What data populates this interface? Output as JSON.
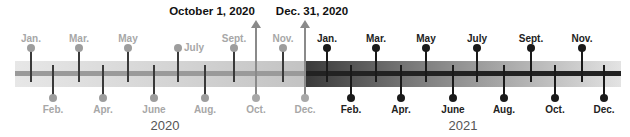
{
  "events": [
    {
      "label": "October 1, 2020",
      "x": 256
    },
    {
      "label": "Dec. 31, 2020",
      "x": 305
    }
  ],
  "years": [
    {
      "label": "2020",
      "x": 165
    },
    {
      "label": "2021",
      "x": 463
    }
  ],
  "months_2020": {
    "top": [
      {
        "label": "Jan.",
        "x": 31
      },
      {
        "label": "Mar.",
        "x": 79
      },
      {
        "label": "May",
        "x": 128
      },
      {
        "label": "July",
        "x": 178
      },
      {
        "label": "Sept.",
        "x": 234
      },
      {
        "label": "Nov.",
        "x": 283
      }
    ],
    "bottom": [
      {
        "label": "Feb.",
        "x": 53
      },
      {
        "label": "Apr.",
        "x": 103
      },
      {
        "label": "June",
        "x": 154
      },
      {
        "label": "Aug.",
        "x": 205
      },
      {
        "label": "Oct.",
        "x": 256
      },
      {
        "label": "Dec.",
        "x": 305
      }
    ]
  },
  "months_2021": {
    "top": [
      {
        "label": "Jan.",
        "x": 327
      },
      {
        "label": "Mar.",
        "x": 376
      },
      {
        "label": "May",
        "x": 426
      },
      {
        "label": "July",
        "x": 477
      },
      {
        "label": "Sept.",
        "x": 531
      },
      {
        "label": "Nov.",
        "x": 582
      }
    ],
    "bottom": [
      {
        "label": "Feb.",
        "x": 351
      },
      {
        "label": "Apr.",
        "x": 401
      },
      {
        "label": "June",
        "x": 453
      },
      {
        "label": "Aug.",
        "x": 504
      },
      {
        "label": "Oct.",
        "x": 555
      },
      {
        "label": "Dec.",
        "x": 604
      }
    ]
  },
  "colors": {
    "past_label": "#a7a7a7",
    "current_label": "#222222",
    "event_text": "#111111"
  }
}
